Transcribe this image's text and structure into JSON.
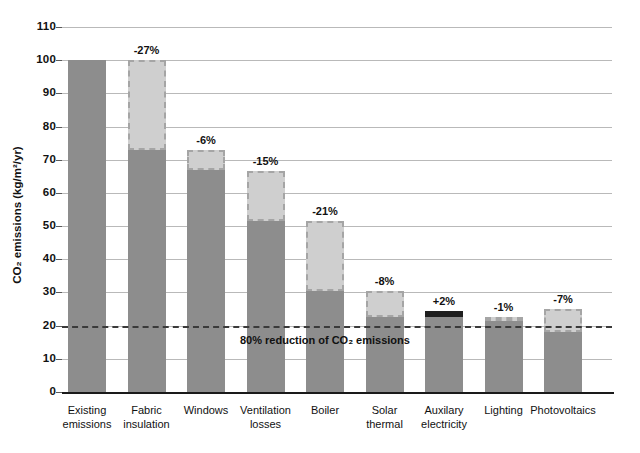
{
  "chart_data": {
    "type": "bar",
    "subtype": "waterfall",
    "title": "",
    "xlabel": "",
    "ylabel": "CO₂ emissions (kg/m²/yr)",
    "ylim": [
      0,
      110
    ],
    "yticks": [
      0,
      10,
      20,
      30,
      40,
      50,
      60,
      70,
      80,
      90,
      100,
      110
    ],
    "ytick_labels": [
      "0",
      "10",
      "20",
      "30",
      "40",
      "50",
      "60",
      "70",
      "80",
      "90",
      "100",
      "110"
    ],
    "grid": true,
    "legend": "none",
    "categories": [
      "Existing\nemissions",
      "Fabric\ninsulation",
      "Windows",
      "Ventilation\nlosses",
      "Boiler",
      "Solar\nthermal",
      "Auxilary\nelectricity",
      "Lighting",
      "Photovoltaics"
    ],
    "bars": [
      {
        "category": "Existing emissions",
        "label_line1": "Existing",
        "label_line2": "emissions",
        "base": 100,
        "top": 100,
        "change": 0,
        "note": "",
        "kind": "total"
      },
      {
        "category": "Fabric insulation",
        "label_line1": "Fabric",
        "label_line2": "insulation",
        "base": 73,
        "top": 100,
        "change": -27,
        "note": "-27%",
        "kind": "decrease"
      },
      {
        "category": "Windows",
        "label_line1": "Windows",
        "label_line2": "",
        "base": 67,
        "top": 73,
        "change": -6,
        "note": "-6%",
        "kind": "decrease"
      },
      {
        "category": "Ventilation losses",
        "label_line1": "Ventilation",
        "label_line2": "losses",
        "base": 51.5,
        "top": 66.5,
        "change": -15,
        "note": "-15%",
        "kind": "decrease"
      },
      {
        "category": "Boiler",
        "label_line1": "Boiler",
        "label_line2": "",
        "base": 30.5,
        "top": 51.5,
        "change": -21,
        "note": "-21%",
        "kind": "decrease"
      },
      {
        "category": "Solar thermal",
        "label_line1": "Solar",
        "label_line2": "thermal",
        "base": 22.5,
        "top": 30.5,
        "change": -8,
        "note": "-8%",
        "kind": "decrease"
      },
      {
        "category": "Auxilary electricity",
        "label_line1": "Auxilary",
        "label_line2": "electricity",
        "base": 22.5,
        "top": 24.5,
        "change": 2,
        "note": "+2%",
        "kind": "increase"
      },
      {
        "category": "Lighting",
        "label_line1": "Lighting",
        "label_line2": "",
        "base": 21.5,
        "top": 22.5,
        "change": -1,
        "note": "-1%",
        "kind": "decrease"
      },
      {
        "category": "Photovoltaics",
        "label_line1": "Photovoltaics",
        "label_line2": "",
        "base": 18,
        "top": 25,
        "change": -7,
        "note": "-7%",
        "kind": "decrease"
      }
    ],
    "reference_line": {
      "value": 20,
      "label": "80% reduction of CO₂ emissions",
      "style": "dashed"
    },
    "colors": {
      "base_bar": "#8d8d8d",
      "saving_segment": "#cfcfcf",
      "saving_border": "#a5a5a5",
      "increase_segment": "#1e1e1e",
      "gridline": "#b9b9b9",
      "axis": "#1a1a1a",
      "text": "#111111",
      "background": "#ffffff"
    }
  }
}
